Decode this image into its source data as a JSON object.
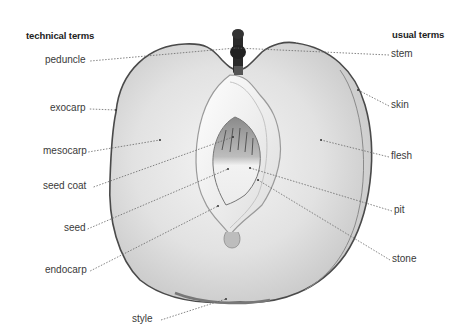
{
  "headers": {
    "left": "technical terms",
    "right": "usual terms"
  },
  "left_labels": [
    {
      "text": "peduncle",
      "x": 45,
      "y": 54,
      "target": [
        236,
        48
      ]
    },
    {
      "text": "exocarp",
      "x": 50,
      "y": 102,
      "target": [
        116,
        110
      ]
    },
    {
      "text": "mesocarp",
      "x": 43,
      "y": 145,
      "target": [
        160,
        140
      ]
    },
    {
      "text": "seed coat",
      "x": 43,
      "y": 180,
      "target": [
        233,
        137
      ]
    },
    {
      "text": "seed",
      "x": 64,
      "y": 222,
      "target": [
        228,
        169
      ]
    },
    {
      "text": "endocarp",
      "x": 45,
      "y": 264,
      "target": [
        218,
        206
      ]
    },
    {
      "text": "style",
      "x": 132,
      "y": 313,
      "target": [
        226,
        299
      ]
    }
  ],
  "right_labels": [
    {
      "text": "stem",
      "x": 391,
      "y": 48,
      "target": [
        236,
        48
      ]
    },
    {
      "text": "skin",
      "x": 391,
      "y": 99,
      "target": [
        358,
        90
      ]
    },
    {
      "text": "flesh",
      "x": 391,
      "y": 150,
      "target": [
        321,
        140
      ]
    },
    {
      "text": "pit",
      "x": 394,
      "y": 204,
      "target": [
        250,
        168
      ]
    },
    {
      "text": "stone",
      "x": 392,
      "y": 253,
      "target": [
        258,
        180
      ]
    }
  ]
}
